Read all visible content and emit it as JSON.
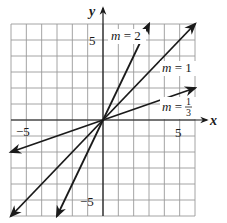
{
  "chart_data": {
    "type": "line",
    "title": "",
    "xlabel": "x",
    "ylabel": "y",
    "xlim": [
      -6,
      6
    ],
    "ylim": [
      -6,
      6
    ],
    "grid": true,
    "x_tick_labels": [
      {
        "value": -5,
        "label": "−5"
      },
      {
        "value": 5,
        "label": "5"
      }
    ],
    "y_tick_labels": [
      {
        "value": 5,
        "label": "5"
      },
      {
        "value": -5,
        "label": "−5"
      }
    ],
    "series": [
      {
        "name": "m = 2",
        "slope": 2,
        "intercept": 0,
        "x": [
          -3,
          3
        ],
        "y": [
          -6,
          6
        ]
      },
      {
        "name": "m = 1",
        "slope": 1,
        "intercept": 0,
        "x": [
          -6,
          6
        ],
        "y": [
          -6,
          6
        ]
      },
      {
        "name": "m = 1/3",
        "slope": 0.3333,
        "intercept": 0,
        "x": [
          -6,
          6
        ],
        "y": [
          -2,
          2
        ]
      }
    ],
    "annotations": [
      {
        "text": "m = 2",
        "near": [
          1.9,
          5.5
        ]
      },
      {
        "text": "m = 1",
        "near": [
          4.8,
          3.0
        ]
      },
      {
        "text": "m = 1/3",
        "near": [
          4.8,
          1.0
        ]
      }
    ]
  },
  "labels": {
    "x_axis": "x",
    "y_axis": "y",
    "x_neg5": "−5",
    "x_pos5": "5",
    "y_pos5": "5",
    "y_neg5": "−5",
    "m2_prefix": "m",
    "m2_rest": " = 2",
    "m1_prefix": "m",
    "m1_rest": " = 1",
    "m13_prefix": "m",
    "m13_eq": " = ",
    "m13_num": "1",
    "m13_den": "3"
  },
  "colors": {
    "grid": "#9a9a9a",
    "axis": "#1a1a1a",
    "line": "#1a1a1a",
    "background": "#ffffff"
  }
}
